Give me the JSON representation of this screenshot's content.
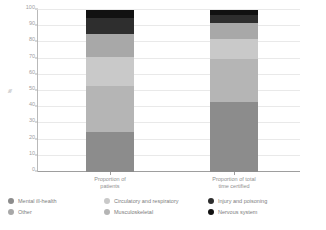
{
  "chart_data": {
    "type": "bar",
    "title": "",
    "subtitle": "",
    "xlabel": "",
    "ylabel": "%",
    "ylim": [
      0,
      100
    ],
    "yticks": [
      0,
      10,
      20,
      30,
      40,
      50,
      60,
      70,
      80,
      90,
      100
    ],
    "ytick_labels": [
      "0",
      "10",
      "20",
      "30",
      "40",
      "50",
      "60",
      "70",
      "80",
      "90",
      "100"
    ],
    "grid": true,
    "stacked": true,
    "legend_position": "bottom",
    "categories": [
      "Proportion of patients",
      "Proportion of total time certified"
    ],
    "category_labels": [
      [
        "Proportion of",
        "patients"
      ],
      [
        "Proportion of total",
        "time certified"
      ]
    ],
    "series": [
      {
        "name": "Mental ill-health",
        "color": "#8c8c8c",
        "values": [
          25,
          43
        ]
      },
      {
        "name": "Musculoskeletal",
        "color": "#b5b5b5",
        "values": [
          28,
          27
        ]
      },
      {
        "name": "Circulatory and respiratory",
        "color": "#c9c9c9",
        "values": [
          18,
          12
        ]
      },
      {
        "name": "Other",
        "color": "#a8a8a8",
        "values": [
          14,
          10
        ]
      },
      {
        "name": "Injury and poisoning",
        "color": "#2e2e2e",
        "values": [
          10,
          5
        ]
      },
      {
        "name": "Nervous system",
        "color": "#111111",
        "values": [
          5,
          3
        ]
      }
    ],
    "cumulative_tops": {
      "Proportion of patients": [
        25,
        53,
        71,
        85,
        95,
        100
      ],
      "Proportion of total time certified": [
        43,
        70,
        82,
        92,
        97,
        100
      ]
    }
  },
  "legend": {
    "columns": [
      {
        "items": [
          {
            "label": "Mental ill-health",
            "color": "#8c8c8c"
          },
          {
            "label": "Other",
            "color": "#a8a8a8"
          }
        ]
      },
      {
        "items": [
          {
            "label": "Circulatory and respiratory",
            "color": "#c9c9c9"
          },
          {
            "label": "Musculoskeletal",
            "color": "#b5b5b5"
          }
        ]
      },
      {
        "items": [
          {
            "label": "Injury and poisoning",
            "color": "#2e2e2e"
          },
          {
            "label": "Nervous system",
            "color": "#111111"
          }
        ]
      }
    ]
  },
  "colors": {
    "background": "#ffffff",
    "grid": "#e9e9e9",
    "axis": "#b9b9b9",
    "tick_text": "#a0a0a0",
    "label_text": "#8f8f8f"
  }
}
